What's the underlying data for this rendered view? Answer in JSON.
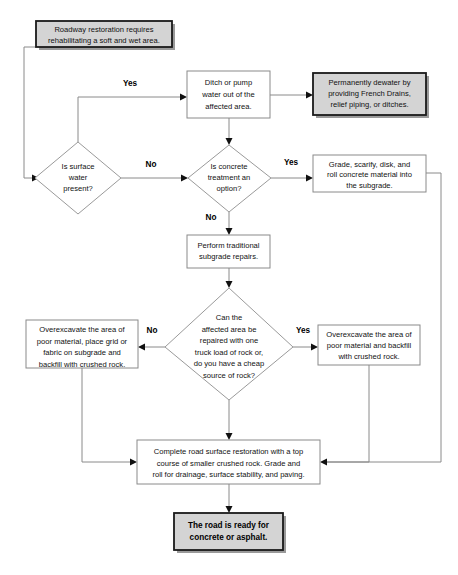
{
  "diagram": {
    "type": "flowchart",
    "colors": {
      "shaded_fill": "#d4d4d4",
      "plain_fill": "#ffffff",
      "border_dark": "#1a1a1a",
      "border_light": "#8a8a8a",
      "text": "#111111"
    },
    "nodes": {
      "start": {
        "shape": "process-shaded",
        "lines": [
          "Roadway restoration requires",
          "rehabilitating a soft and wet area."
        ]
      },
      "ditch_pump": {
        "shape": "process",
        "lines": [
          "Ditch or pump",
          "water out of the",
          "affected area."
        ]
      },
      "dewater": {
        "shape": "process-shaded",
        "lines": [
          "Permanently dewater by",
          "providing French Drains,",
          "relief piping, or ditches."
        ]
      },
      "surface_water": {
        "shape": "decision",
        "lines": [
          "Is surface",
          "water",
          "present?"
        ]
      },
      "concrete_treatment": {
        "shape": "decision",
        "lines": [
          "Is concrete",
          "treatment an",
          "option?"
        ]
      },
      "grade_scarify": {
        "shape": "process",
        "lines": [
          "Grade, scarify, disk, and",
          "roll concrete  material into",
          "the subgrade."
        ]
      },
      "traditional_repairs": {
        "shape": "process",
        "lines": [
          "Perform traditional",
          "subgrade repairs."
        ]
      },
      "one_truck_load": {
        "shape": "decision",
        "lines": [
          "Can the",
          "affected area be",
          "repaired with one",
          "truck load of rock or,",
          "do you have a cheap",
          "source of rock?"
        ]
      },
      "overexcavate_grid": {
        "shape": "process",
        "lines": [
          "Overexcavate the area of",
          "poor material, place grid or",
          "fabric on subgrade and",
          "backfill with crushed rock."
        ]
      },
      "overexcavate_backfill": {
        "shape": "process",
        "lines": [
          "Overexcavate the area of",
          "poor material and backfill",
          "with crushed rock."
        ]
      },
      "complete_restoration": {
        "shape": "process",
        "lines": [
          "Complete road surface restoration with a top",
          "course of smaller crushed rock. Grade and",
          "roll for drainage, surface stability, and paving."
        ]
      },
      "road_ready": {
        "shape": "terminator-shaded",
        "lines": [
          "The road is ready for",
          "concrete or asphalt."
        ]
      }
    },
    "edge_labels": {
      "surface_water_yes": "Yes",
      "surface_water_no": "No",
      "concrete_yes": "Yes",
      "concrete_no": "No",
      "truckload_no": "No",
      "truckload_yes": "Yes"
    }
  }
}
